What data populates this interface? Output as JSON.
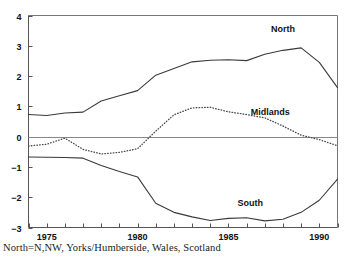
{
  "caption": "North=N,NW, Yorks/Humberside, Wales, Scotland",
  "axis": {
    "y_ticks": [
      "4",
      "3",
      "2",
      "1",
      "0",
      "−1",
      "−2",
      "−3"
    ],
    "x_ticks": [
      "1975",
      "1980",
      "1985",
      "1990"
    ]
  },
  "labels": {
    "north": "North",
    "midlands": "Midlands",
    "south": "South"
  },
  "chart_data": {
    "type": "line",
    "title": "",
    "xlabel": "",
    "ylabel": "",
    "xlim": [
      1974,
      1991
    ],
    "ylim": [
      -3,
      4
    ],
    "grid": false,
    "legend": "inline-annotations",
    "x": [
      1974,
      1975,
      1976,
      1977,
      1978,
      1979,
      1980,
      1981,
      1982,
      1983,
      1984,
      1985,
      1986,
      1987,
      1988,
      1989,
      1990,
      1991
    ],
    "y_tick_values": [
      4,
      3,
      2,
      1,
      0,
      -1,
      -2,
      -3
    ],
    "x_tick_values": [
      1974,
      1975,
      1976,
      1977,
      1978,
      1979,
      1980,
      1981,
      1982,
      1983,
      1984,
      1985,
      1986,
      1987,
      1988,
      1989,
      1990,
      1991
    ],
    "x_tick_labeled": [
      1975,
      1980,
      1985,
      1990
    ],
    "series": [
      {
        "name": "North",
        "style": "solid",
        "values": [
          0.73,
          0.7,
          0.78,
          0.81,
          1.18,
          1.35,
          1.52,
          2.03,
          2.25,
          2.47,
          2.52,
          2.54,
          2.51,
          2.72,
          2.85,
          2.93,
          2.45,
          1.62
        ]
      },
      {
        "name": "Midlands",
        "style": "dotted",
        "values": [
          -0.31,
          -0.25,
          -0.05,
          -0.42,
          -0.57,
          -0.52,
          -0.4,
          0.18,
          0.72,
          0.95,
          0.97,
          0.82,
          0.73,
          0.62,
          0.35,
          0.05,
          -0.1,
          -0.3
        ]
      },
      {
        "name": "South",
        "style": "solid",
        "values": [
          -0.67,
          -0.68,
          -0.69,
          -0.71,
          -0.95,
          -1.15,
          -1.33,
          -2.2,
          -2.5,
          -2.65,
          -2.77,
          -2.7,
          -2.68,
          -2.78,
          -2.73,
          -2.5,
          -2.1,
          -1.4
        ]
      }
    ],
    "annotations": [
      {
        "text": "North",
        "x": 1988.0,
        "y": 3.45
      },
      {
        "text": "Midlands",
        "x": 1987.3,
        "y": 0.72
      },
      {
        "text": "South",
        "x": 1986.2,
        "y": -2.28
      }
    ]
  }
}
